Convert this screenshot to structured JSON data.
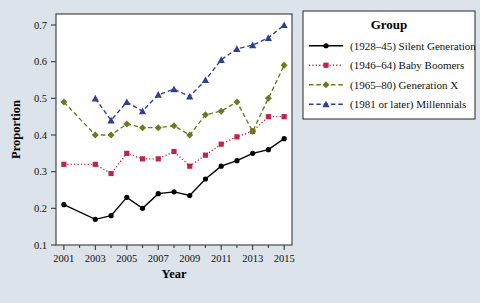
{
  "chart_data": {
    "type": "line",
    "title": "",
    "xlabel": "Year",
    "ylabel": "Proportion",
    "xlim": [
      2000.5,
      2015.5
    ],
    "ylim": [
      0.1,
      0.73
    ],
    "grid": false,
    "legend_position": "right",
    "legend_title": "Group",
    "x_ticks": [
      2001,
      2003,
      2005,
      2007,
      2009,
      2011,
      2013,
      2015
    ],
    "x_tick_labels": [
      "2001",
      "2003",
      "2005",
      "2007",
      "2009",
      "2011",
      "2013",
      "2015"
    ],
    "x_minor_ticks": [
      2002,
      2004,
      2006,
      2008,
      2010,
      2012,
      2014
    ],
    "y_ticks": [
      0.1,
      0.2,
      0.3,
      0.4,
      0.5,
      0.6,
      0.7
    ],
    "y_tick_labels": [
      "0.1",
      "0.2",
      "0.3",
      "0.4",
      "0.5",
      "0.6",
      "0.7"
    ],
    "series": [
      {
        "name": "(1928–45) Silent Generation",
        "color": "#000000",
        "marker": "circle",
        "dash": "solid",
        "x": [
          2001,
          2003,
          2004,
          2005,
          2006,
          2007,
          2008,
          2009,
          2010,
          2011,
          2012,
          2013,
          2014,
          2015
        ],
        "values": [
          0.21,
          0.17,
          0.18,
          0.23,
          0.2,
          0.24,
          0.245,
          0.235,
          0.28,
          0.315,
          0.33,
          0.35,
          0.36,
          0.39
        ]
      },
      {
        "name": "(1946–64) Baby Boomers",
        "color": "#c0234b",
        "marker": "square",
        "dash": "dotted",
        "x": [
          2001,
          2003,
          2004,
          2005,
          2006,
          2007,
          2008,
          2009,
          2010,
          2011,
          2012,
          2013,
          2014,
          2015
        ],
        "values": [
          0.32,
          0.32,
          0.295,
          0.35,
          0.335,
          0.335,
          0.355,
          0.315,
          0.345,
          0.375,
          0.395,
          0.41,
          0.45,
          0.45
        ]
      },
      {
        "name": "(1965–80) Generation X",
        "color": "#6b7a1e",
        "marker": "diamond",
        "dash": "dashed",
        "x": [
          2001,
          2003,
          2004,
          2005,
          2006,
          2007,
          2008,
          2009,
          2010,
          2011,
          2012,
          2013,
          2014,
          2015
        ],
        "values": [
          0.49,
          0.4,
          0.4,
          0.43,
          0.42,
          0.42,
          0.425,
          0.4,
          0.455,
          0.465,
          0.49,
          0.41,
          0.5,
          0.59
        ]
      },
      {
        "name": "(1981 or later) Millennials",
        "color": "#2f3f8f",
        "marker": "triangle",
        "dash": "dashed",
        "x": [
          2003,
          2004,
          2005,
          2006,
          2007,
          2008,
          2009,
          2010,
          2011,
          2012,
          2013,
          2014,
          2015
        ],
        "values": [
          0.5,
          0.44,
          0.49,
          0.465,
          0.51,
          0.525,
          0.505,
          0.55,
          0.605,
          0.635,
          0.645,
          0.665,
          0.7
        ]
      }
    ]
  },
  "axes": {
    "x_title": "Year",
    "y_title": "Proportion"
  },
  "legend": {
    "title": "Group",
    "entries": [
      {
        "label": "(1928–45) Silent Generation",
        "color": "#000000"
      },
      {
        "label": "(1946–64) Baby Boomers",
        "color": "#c0234b"
      },
      {
        "label": "(1965–80) Generation X",
        "color": "#6b7a1e"
      },
      {
        "label": "(1981 or later) Millennials",
        "color": "#2f3f8f"
      }
    ]
  }
}
